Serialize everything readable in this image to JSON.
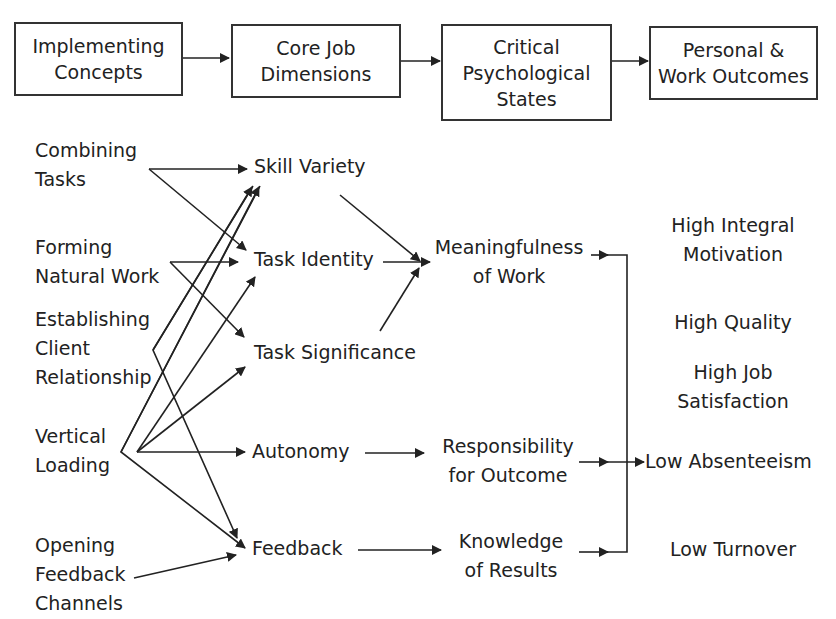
{
  "header_boxes": [
    {
      "lines": [
        "Implementing",
        "Concepts"
      ]
    },
    {
      "lines": [
        "Core Job",
        "Dimensions"
      ]
    },
    {
      "lines": [
        "Critical",
        "Psychological",
        "States"
      ]
    },
    {
      "lines": [
        "Personal &",
        "Work Outcomes"
      ]
    }
  ],
  "implementing_concepts": [
    {
      "lines": [
        "Combining",
        "Tasks"
      ]
    },
    {
      "lines": [
        "Forming",
        "Natural Work"
      ]
    },
    {
      "lines": [
        "Establishing",
        "Client",
        "Relationship"
      ]
    },
    {
      "lines": [
        "Vertical",
        "Loading"
      ]
    },
    {
      "lines": [
        "Opening",
        "Feedback",
        "Channels"
      ]
    }
  ],
  "core_job_dimensions": [
    "Skill Variety",
    "Task Identity",
    "Task Significance",
    "Autonomy",
    "Feedback"
  ],
  "psychological_states": [
    {
      "lines": [
        "Meaningfulness",
        "of Work"
      ]
    },
    {
      "lines": [
        "Responsibility",
        "for Outcome"
      ]
    },
    {
      "lines": [
        "Knowledge",
        "of Results"
      ]
    }
  ],
  "outcomes": [
    {
      "lines": [
        "High Integral",
        "Motivation"
      ]
    },
    {
      "lines": [
        "High Quality"
      ]
    },
    {
      "lines": [
        "High Job",
        "Satisfaction"
      ]
    },
    {
      "lines": [
        "Low Absenteeism"
      ]
    },
    {
      "lines": [
        "Low Turnover"
      ]
    }
  ],
  "line_color": "#222222"
}
